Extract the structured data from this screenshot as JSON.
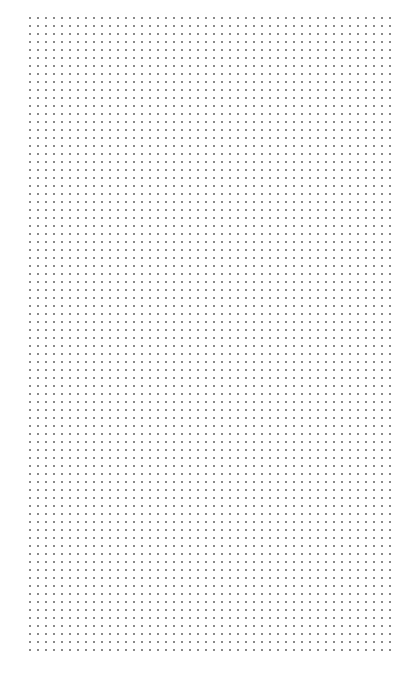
{
  "page": {
    "type": "dot-grid-paper",
    "background_color": "#ffffff",
    "dot_color": "#8a8a8a",
    "grid": {
      "spacing_px": 8,
      "columns": 46,
      "rows": 80
    }
  }
}
